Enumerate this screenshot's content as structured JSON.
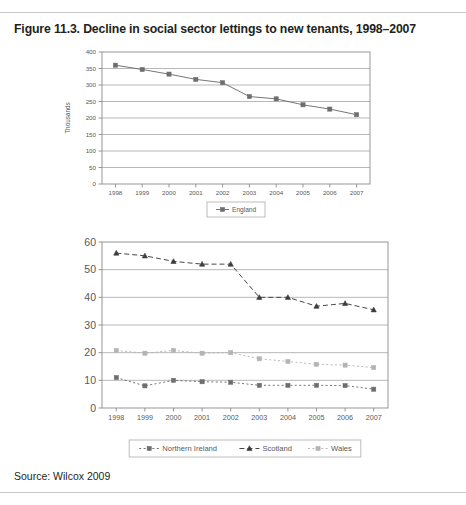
{
  "figure": {
    "title": "Figure 11.3. Decline in social sector lettings to new tenants, 1998–2007",
    "source": "Source: Wilcox 2009"
  },
  "chart_data": [
    {
      "id": "england-chart",
      "type": "line",
      "title": "",
      "xlabel": "",
      "ylabel": "Thousands",
      "x": [
        "1998",
        "1999",
        "2000",
        "2001",
        "2002",
        "2003",
        "2004",
        "2005",
        "2006",
        "2007"
      ],
      "ylim": [
        0,
        400
      ],
      "yticks": [
        0,
        50,
        100,
        150,
        200,
        250,
        300,
        350,
        400
      ],
      "grid": true,
      "legend_position": "bottom",
      "series": [
        {
          "name": "England",
          "marker": "square",
          "line_style": "solid",
          "color": "#6d6e70",
          "values": [
            360,
            347,
            333,
            317,
            307,
            265,
            258,
            240,
            227,
            210
          ]
        }
      ]
    },
    {
      "id": "nations-chart",
      "type": "line",
      "title": "",
      "xlabel": "",
      "ylabel": "",
      "x": [
        "1998",
        "1999",
        "2000",
        "2001",
        "2002",
        "2003",
        "2004",
        "2005",
        "2006",
        "2007"
      ],
      "ylim": [
        0,
        60
      ],
      "yticks": [
        0,
        10,
        20,
        30,
        40,
        50,
        60
      ],
      "grid": true,
      "legend_position": "bottom",
      "series": [
        {
          "name": "Northern Ireland",
          "marker": "square",
          "line_style": "dotted",
          "color": "#6d6e70",
          "values": [
            11.0,
            8.0,
            10.0,
            9.5,
            9.3,
            8.2,
            8.2,
            8.2,
            8.1,
            6.8
          ]
        },
        {
          "name": "Scotland",
          "marker": "triangle",
          "line_style": "dashed",
          "color": "#3c3c3c",
          "values": [
            56.0,
            55.0,
            53.0,
            52.0,
            52.0,
            40.0,
            40.0,
            36.8,
            37.8,
            35.5
          ]
        },
        {
          "name": "Wales",
          "marker": "square",
          "line_style": "dotted",
          "color": "#b4b4b4",
          "values": [
            20.8,
            19.8,
            20.8,
            19.8,
            20.0,
            17.8,
            16.8,
            15.8,
            15.5,
            14.6
          ]
        }
      ]
    }
  ]
}
